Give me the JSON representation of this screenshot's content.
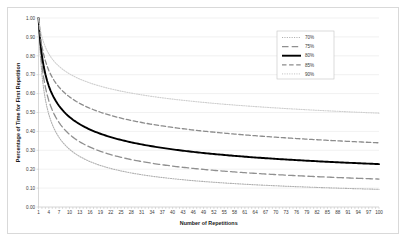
{
  "chart_data": {
    "type": "line",
    "title": "",
    "xlabel": "Number of Repetitions",
    "ylabel": "Percentage of Time for First Repetition",
    "xlim": [
      1,
      100
    ],
    "ylim": [
      0.0,
      1.0
    ],
    "grid": true,
    "legend_position": "top-right",
    "x_tick_labels": [
      "1",
      "4",
      "7",
      "10",
      "13",
      "16",
      "19",
      "22",
      "25",
      "28",
      "31",
      "34",
      "37",
      "40",
      "43",
      "46",
      "49",
      "52",
      "55",
      "58",
      "61",
      "64",
      "67",
      "70",
      "73",
      "76",
      "79",
      "82",
      "85",
      "88",
      "91",
      "94",
      "97",
      "100"
    ],
    "y_tick_labels": [
      "0.00",
      "0.10",
      "0.20",
      "0.30",
      "0.40",
      "0.50",
      "0.60",
      "0.70",
      "0.80",
      "0.90",
      "1.00"
    ],
    "y_tick_values": [
      0.0,
      0.1,
      0.2,
      0.3,
      0.4,
      0.5,
      0.6,
      0.7,
      0.8,
      0.9,
      1.0
    ],
    "series": [
      {
        "name": "70%",
        "rate": 0.7,
        "color": "#b0b0b0",
        "style": "fine-dotted",
        "x": [
          1,
          2,
          3,
          4,
          5,
          6,
          7,
          8,
          9,
          10,
          12,
          14,
          16,
          18,
          20,
          25,
          30,
          35,
          40,
          45,
          50,
          60,
          70,
          80,
          90,
          100
        ],
        "values": [
          1.0,
          0.7,
          0.57,
          0.49,
          0.44,
          0.4,
          0.37,
          0.34,
          0.32,
          0.31,
          0.28,
          0.26,
          0.24,
          0.23,
          0.22,
          0.19,
          0.18,
          0.16,
          0.15,
          0.15,
          0.14,
          0.13,
          0.12,
          0.12,
          0.11,
          0.11
        ]
      },
      {
        "name": "75%",
        "rate": 0.75,
        "color": "#909090",
        "style": "long-dash",
        "x": [
          1,
          2,
          3,
          4,
          5,
          6,
          7,
          8,
          9,
          10,
          12,
          14,
          16,
          18,
          20,
          25,
          30,
          35,
          40,
          45,
          50,
          60,
          70,
          80,
          90,
          100
        ],
        "values": [
          1.0,
          0.75,
          0.63,
          0.56,
          0.51,
          0.47,
          0.45,
          0.42,
          0.4,
          0.39,
          0.36,
          0.34,
          0.32,
          0.3,
          0.29,
          0.26,
          0.24,
          0.23,
          0.22,
          0.21,
          0.2,
          0.19,
          0.18,
          0.17,
          0.16,
          0.16
        ]
      },
      {
        "name": "80%",
        "rate": 0.8,
        "color": "#000000",
        "style": "solid-bold",
        "x": [
          1,
          2,
          3,
          4,
          5,
          6,
          7,
          8,
          9,
          10,
          12,
          14,
          16,
          18,
          20,
          25,
          30,
          35,
          40,
          45,
          50,
          60,
          70,
          80,
          90,
          100
        ],
        "values": [
          1.0,
          0.8,
          0.7,
          0.64,
          0.6,
          0.56,
          0.53,
          0.51,
          0.49,
          0.48,
          0.45,
          0.43,
          0.41,
          0.4,
          0.38,
          0.36,
          0.34,
          0.32,
          0.31,
          0.3,
          0.29,
          0.28,
          0.27,
          0.26,
          0.25,
          0.24
        ]
      },
      {
        "name": "85%",
        "rate": 0.85,
        "color": "#8c8c8c",
        "style": "dash",
        "x": [
          1,
          2,
          3,
          4,
          5,
          6,
          7,
          8,
          9,
          10,
          12,
          14,
          16,
          18,
          20,
          25,
          30,
          35,
          40,
          45,
          50,
          60,
          70,
          80,
          90,
          100
        ],
        "values": [
          1.0,
          0.85,
          0.77,
          0.72,
          0.69,
          0.66,
          0.64,
          0.61,
          0.6,
          0.58,
          0.56,
          0.54,
          0.52,
          0.51,
          0.5,
          0.47,
          0.45,
          0.44,
          0.43,
          0.42,
          0.41,
          0.39,
          0.38,
          0.37,
          0.36,
          0.36
        ]
      },
      {
        "name": "90%",
        "rate": 0.9,
        "color": "#cfcfcf",
        "style": "fine-dotted",
        "x": [
          1,
          2,
          3,
          4,
          5,
          6,
          7,
          8,
          9,
          10,
          12,
          14,
          16,
          18,
          20,
          25,
          30,
          35,
          40,
          45,
          50,
          60,
          70,
          80,
          90,
          100
        ],
        "values": [
          1.0,
          0.9,
          0.85,
          0.81,
          0.78,
          0.76,
          0.74,
          0.73,
          0.72,
          0.7,
          0.68,
          0.67,
          0.66,
          0.65,
          0.64,
          0.62,
          0.6,
          0.59,
          0.58,
          0.57,
          0.56,
          0.55,
          0.54,
          0.53,
          0.52,
          0.51
        ]
      }
    ],
    "legend_entries": [
      {
        "label": "70%",
        "color": "#b0b0b0",
        "style": "fine-dotted"
      },
      {
        "label": "75%",
        "color": "#909090",
        "style": "long-dash"
      },
      {
        "label": "80%",
        "color": "#000000",
        "style": "solid-bold"
      },
      {
        "label": "85%",
        "color": "#8c8c8c",
        "style": "dash"
      },
      {
        "label": "90%",
        "color": "#cfcfcf",
        "style": "fine-dotted"
      }
    ]
  }
}
